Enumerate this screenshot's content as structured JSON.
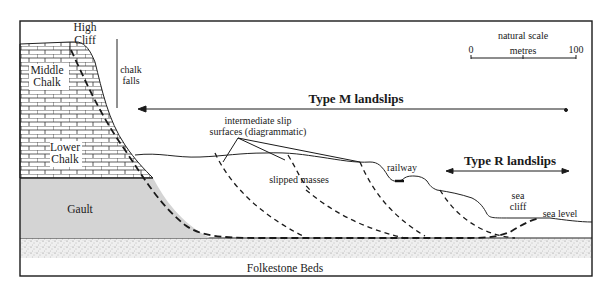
{
  "figure": {
    "labels": {
      "high_cliff_line1": "High",
      "high_cliff_line2": "Cliff",
      "middle_chalk_line1": "Middle",
      "middle_chalk_line2": "Chalk",
      "lower_chalk_line1": "Lower",
      "lower_chalk_line2": "Chalk",
      "chalk_falls_line1": "chalk",
      "chalk_falls_line2": "falls",
      "gault": "Gault",
      "folkestone_beds": "Folkestone Beds",
      "type_m": "Type M landslips",
      "type_r": "Type R landslips",
      "intermediate_line1": "intermediate slip",
      "intermediate_line2": "surfaces (diagrammatic)",
      "slipped_masses": "slipped masses",
      "railway": "railway",
      "sea_cliff_line1": "sea",
      "sea_cliff_line2": "cliff",
      "sea_level": "sea level"
    },
    "scale_bar": {
      "title": "natural scale",
      "unit": "metres",
      "min": "0",
      "max": "100"
    },
    "colors": {
      "line": "#1a1a1a",
      "gault_fill": "#d4d4d4",
      "sand_fill": "#ececec",
      "chalk_fill": "#ffffff"
    }
  }
}
